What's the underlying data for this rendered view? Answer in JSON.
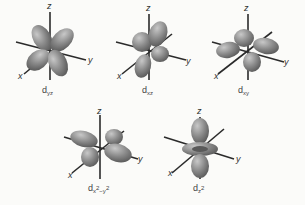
{
  "figure": {
    "axis_labels": {
      "x": "x",
      "y": "y",
      "z": "z"
    },
    "colors": {
      "lobe": "#8a8a8a",
      "lobe_highlight": "#c4c4c4",
      "lobe_shadow": "#5e5e5e",
      "axis": "#2b2b2b",
      "background": "#fbfbf9"
    },
    "orbitals": [
      {
        "id": "dyz",
        "base": "d",
        "sub": "yz",
        "row": 1,
        "col": 1
      },
      {
        "id": "dxz",
        "base": "d",
        "sub": "xz",
        "row": 1,
        "col": 2
      },
      {
        "id": "dxy",
        "base": "d",
        "sub": "xy",
        "row": 1,
        "col": 3
      },
      {
        "id": "dx2-y2",
        "base": "d",
        "sub1": "x",
        "sup1": "2",
        "mid": "−y",
        "sup2": "2",
        "row": 2,
        "col": 1
      },
      {
        "id": "dz2",
        "base": "d",
        "sub": "z",
        "sup": "2",
        "row": 2,
        "col": 2
      }
    ]
  }
}
